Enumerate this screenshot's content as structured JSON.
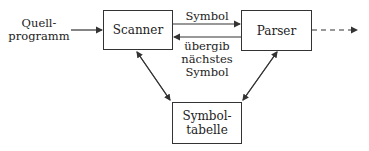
{
  "diagram": {
    "input_label_line1": "Quell-",
    "input_label_line2": "programm",
    "nodes": {
      "scanner": "Scanner",
      "parser": "Parser",
      "symtab_line1": "Symbol-",
      "symtab_line2": "tabelle"
    },
    "edges": {
      "symbol": "Symbol",
      "request_line1": "übergib",
      "request_line2": "nächstes",
      "request_line3": "Symbol"
    }
  }
}
